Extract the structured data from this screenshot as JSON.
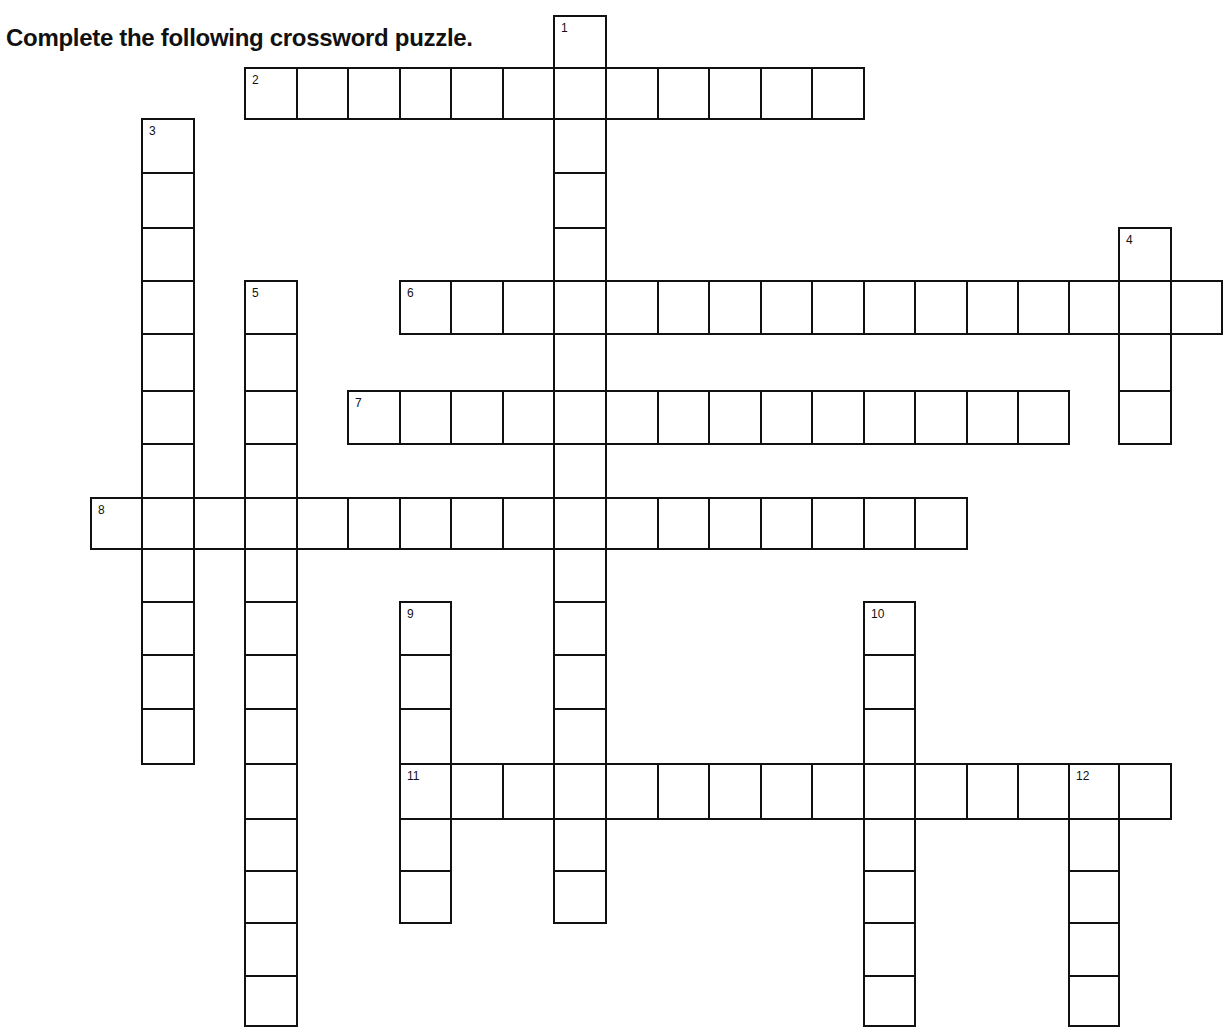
{
  "instruction": "Complete the following crossword puzzle.",
  "grid_geometry": {
    "col_x": [
      90,
      141,
      193,
      244,
      296,
      347,
      399,
      450,
      502,
      553,
      605,
      657,
      708,
      760,
      811,
      863,
      914,
      966,
      1017,
      1068,
      1118,
      1170,
      1221
    ],
    "row_y": [
      15,
      67,
      118,
      172,
      227,
      280,
      333,
      390,
      443,
      497,
      548,
      601,
      654,
      708,
      763,
      818,
      870,
      922,
      975,
      1025
    ]
  },
  "entries": [
    {
      "number": "1",
      "direction": "down",
      "col": 9,
      "row": 0,
      "length": 17
    },
    {
      "number": "2",
      "direction": "across",
      "col": 3,
      "row": 1,
      "length": 12
    },
    {
      "number": "3",
      "direction": "down",
      "col": 1,
      "row": 2,
      "length": 12
    },
    {
      "number": "4",
      "direction": "down",
      "col": 20,
      "row": 4,
      "length": 4
    },
    {
      "number": "5",
      "direction": "down",
      "col": 3,
      "row": 5,
      "length": 14
    },
    {
      "number": "6",
      "direction": "across",
      "col": 6,
      "row": 5,
      "length": 16
    },
    {
      "number": "7",
      "direction": "across",
      "col": 5,
      "row": 7,
      "length": 14
    },
    {
      "number": "8",
      "direction": "across",
      "col": 0,
      "row": 9,
      "length": 17
    },
    {
      "number": "9",
      "direction": "down",
      "col": 6,
      "row": 11,
      "length": 6
    },
    {
      "number": "10",
      "direction": "down",
      "col": 15,
      "row": 11,
      "length": 8
    },
    {
      "number": "11",
      "direction": "across",
      "col": 6,
      "row": 14,
      "length": 15
    },
    {
      "number": "12",
      "direction": "down",
      "col": 19,
      "row": 14,
      "length": 5
    }
  ]
}
